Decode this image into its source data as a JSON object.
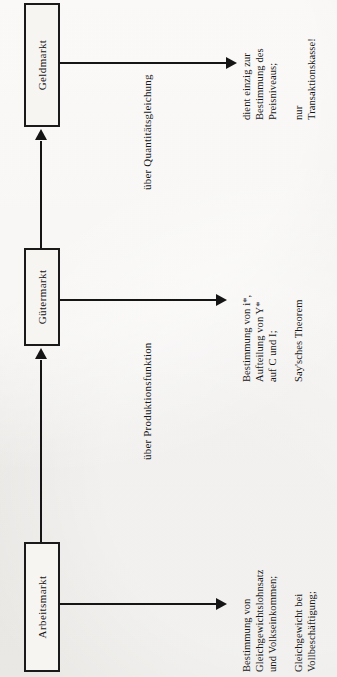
{
  "diagram": {
    "orientation": "rotated-90-ccw",
    "background_color": "#f1efec",
    "line_color": "#151515",
    "nodes": [
      {
        "id": "geldmarkt",
        "label": "Geldmarkt"
      },
      {
        "id": "guetermarkt",
        "label": "Gütermarkt"
      },
      {
        "id": "arbeitsmarkt",
        "label": "Arbeitsmarkt"
      }
    ],
    "edge_labels": [
      {
        "id": "quantitaetsgleichung",
        "label": "über Quantitätsgleichung"
      },
      {
        "id": "produktionsfunktion",
        "label": "über Produktionsfunktion"
      }
    ],
    "annotations": [
      {
        "id": "geldmarkt-note",
        "for": "geldmarkt",
        "group_a": [
          "dient einzig zur",
          "Bestimmung des",
          "Preisniveaus;"
        ],
        "group_b": [
          "nur",
          "Transaktionskasse!"
        ]
      },
      {
        "id": "guetermarkt-note",
        "for": "guetermarkt",
        "group_a": [
          "Bestimmung von i*,",
          "Aufteilung von Y*",
          "auf C und I;"
        ],
        "group_b": [
          "Say'sches Theorem"
        ]
      },
      {
        "id": "arbeitsmarkt-note",
        "for": "arbeitsmarkt",
        "group_a": [
          "Bestimmung von",
          "Gleichgewichtslohnsatz",
          "und Volkseinkommen;"
        ],
        "group_b": [
          "Gleichgewicht bei",
          "Vollbeschäftigung;"
        ]
      }
    ]
  }
}
